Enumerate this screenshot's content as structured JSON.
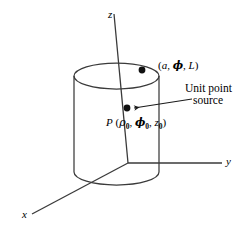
{
  "figure": {
    "type": "geometry-diagram",
    "background_color": "#ffffff",
    "line_color": "#1a1a1a"
  },
  "axes": {
    "z": {
      "label": "z",
      "origin": [
        128,
        163
      ],
      "tip": [
        114,
        14
      ]
    },
    "y": {
      "label": "y",
      "origin": [
        128,
        163
      ],
      "tip": [
        222,
        163
      ]
    },
    "x": {
      "label": "x",
      "origin": [
        128,
        163
      ],
      "tip": [
        32,
        214
      ]
    }
  },
  "cylinder": {
    "top_ellipse": {
      "cx": 116.5,
      "cy": 76,
      "rx": 42.5,
      "ry": 13
    },
    "bottom_ellipse": {
      "cx": 116.5,
      "cy": 172,
      "rx": 42.5,
      "ry": 13
    },
    "left_wall_x": 74,
    "right_wall_x": 159,
    "top_y": 76,
    "bottom_y": 172
  },
  "points": [
    {
      "id": "rim-point",
      "label": "(a, ϕ, L)",
      "label_parts": {
        "prefix": "(",
        "a": "a",
        "phi": "ϕ",
        "L": "L",
        "suffix": ")"
      },
      "x": 142,
      "y": 70,
      "radius": 3.4
    },
    {
      "id": "source-point",
      "label": "P (ρ₀, ϕ₀, z₀)",
      "x": 127,
      "y": 108,
      "radius": 3.4
    }
  ],
  "labels": {
    "rim_point": {
      "open": "(",
      "a": "a",
      "comma1": ", ",
      "phi": "ϕ",
      "comma2": ", ",
      "L": "L",
      "close": ")"
    },
    "source_point": {
      "P": "P",
      "open": " (",
      "rho": "ρ",
      "rho_sub": "0",
      "comma1": ", ",
      "phi": "ϕ",
      "phi_sub": "0",
      "comma2": ", ",
      "z": "z",
      "z_sub": "0",
      "close": ")"
    },
    "callout": {
      "line1": "Unit point",
      "line2": "source"
    }
  },
  "leader": {
    "from": [
      192,
      99
    ],
    "to": [
      133,
      108
    ],
    "arrowhead": true
  }
}
